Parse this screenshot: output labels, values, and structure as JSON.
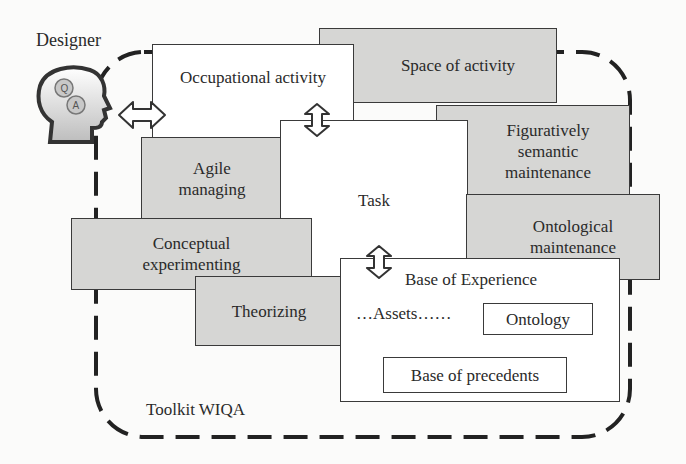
{
  "diagram": {
    "actor": {
      "label": "Designer",
      "icon": "head-with-gears-icon",
      "gear_labels": [
        "Q",
        "A"
      ]
    },
    "boundary": {
      "label": "Toolkit WIQA",
      "style": "dashed-rounded"
    },
    "boxes": {
      "occupational_activity": {
        "label": "Occupational activity",
        "fill": "#ffffff"
      },
      "space_of_activity": {
        "label": "Space of activity",
        "fill": "#d6d6d4"
      },
      "figuratively_semantic": {
        "line1": "Figuratively",
        "line2": "semantic",
        "line3": "maintenance",
        "fill": "#d6d6d4"
      },
      "agile_managing": {
        "line1": "Agile",
        "line2": "managing",
        "fill": "#d6d6d4"
      },
      "task": {
        "label": "Task",
        "fill": "#ffffff"
      },
      "ontological_maintenance": {
        "line1": "Ontological",
        "line2": "maintenance",
        "fill": "#d6d6d4"
      },
      "conceptual_experimenting": {
        "line1": "Conceptual",
        "line2": "experimenting",
        "fill": "#d6d6d4"
      },
      "theorizing": {
        "label": "Theorizing",
        "fill": "#d6d6d4"
      },
      "base_of_experience": {
        "title": "Base of Experience",
        "assets": "…Assets……",
        "ontology": "Ontology",
        "precedents": "Base of precedents",
        "fill": "#ffffff"
      }
    },
    "arrows": [
      {
        "from": "Designer",
        "to": "Occupational activity",
        "type": "double-horizontal"
      },
      {
        "from": "Occupational activity",
        "to": "Task",
        "type": "double-vertical"
      },
      {
        "from": "Task",
        "to": "Base of Experience",
        "type": "double-vertical"
      }
    ]
  }
}
